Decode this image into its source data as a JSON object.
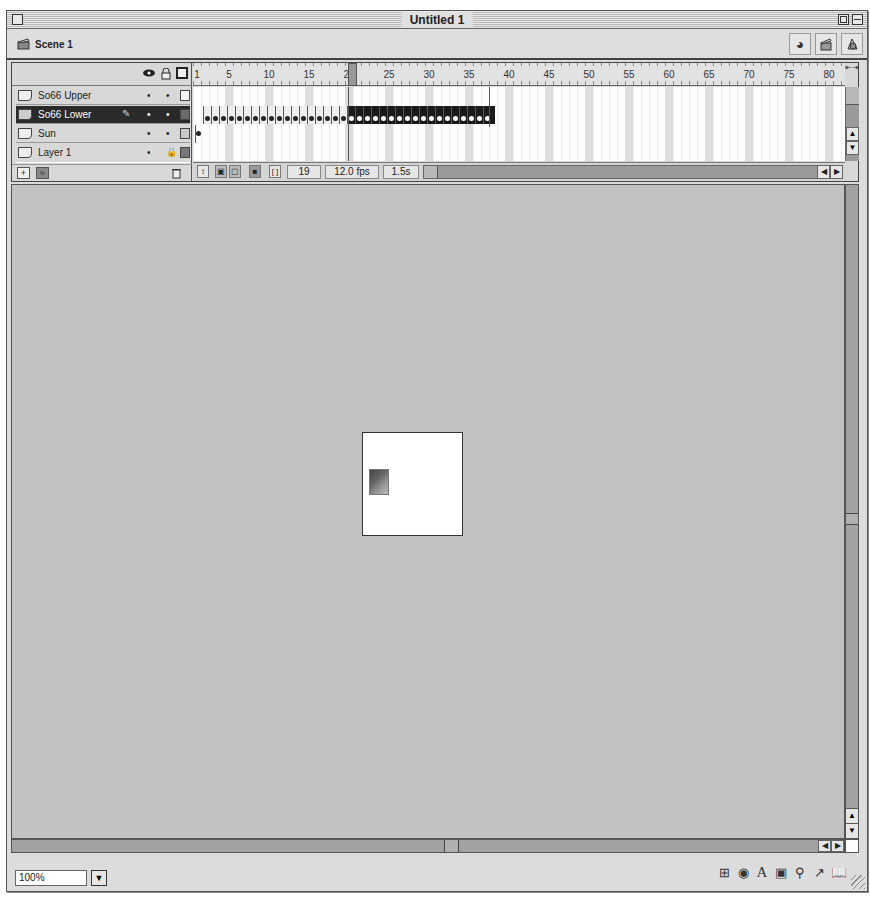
{
  "window": {
    "title": "Untitled 1"
  },
  "scene_bar": {
    "scene_label": "Scene 1",
    "tools": [
      {
        "name": "edit-scene-icon",
        "glyph": "◕"
      },
      {
        "name": "edit-symbols-icon",
        "glyph": "🎬"
      },
      {
        "name": "edit-symbols-shape-icon",
        "glyph": "◭"
      }
    ]
  },
  "timeline": {
    "header_icons": {
      "eye": "👁",
      "lock": "🔒",
      "outline": "□"
    },
    "layers": [
      {
        "name": "So66 Upper",
        "selected": false,
        "color": "#f2f2f2",
        "locked": false
      },
      {
        "name": "So66 Lower",
        "selected": true,
        "color": "#6a6a6a",
        "locked": false,
        "editing": true
      },
      {
        "name": "Sun",
        "selected": false,
        "color": "#c8c8c8",
        "locked": false
      },
      {
        "name": "Layer 1",
        "selected": false,
        "color": "#777777",
        "locked": true
      }
    ],
    "ruler_labels": [
      "1",
      "5",
      "10",
      "15",
      "20",
      "25",
      "30",
      "35",
      "40",
      "45",
      "50",
      "55",
      "60",
      "65",
      "70",
      "75",
      "80"
    ],
    "current_frame": "19",
    "frame_rate": "12.0 fps",
    "elapsed_time": "1.5s",
    "footer_buttons": {
      "add_layer": "+",
      "add_guide": "≈",
      "delete_layer": "🗑"
    },
    "status_buttons": [
      "center-frame",
      "onion-skin",
      "onion-skin-outlines",
      "edit-multiple-frames",
      "modify-onion-markers"
    ]
  },
  "stage": {
    "width": 101,
    "height": 104
  },
  "status_bar": {
    "zoom_value": "100%",
    "launcher_icons": [
      {
        "name": "info-panel-icon",
        "glyph": "⊞"
      },
      {
        "name": "mixer-icon",
        "glyph": "◉"
      },
      {
        "name": "character-icon",
        "glyph": "A"
      },
      {
        "name": "instance-icon",
        "glyph": "▣"
      },
      {
        "name": "movie-explorer-icon",
        "glyph": "⚲"
      },
      {
        "name": "actions-icon",
        "glyph": "↗"
      },
      {
        "name": "library-icon",
        "glyph": "📖"
      }
    ]
  }
}
